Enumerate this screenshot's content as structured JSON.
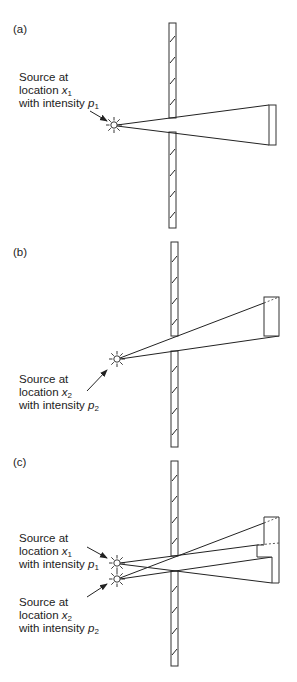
{
  "panels": [
    {
      "id": "a",
      "label": "(a)",
      "sources": [
        {
          "line1": "Source at",
          "line2_prefix": "location ",
          "var": "x",
          "var_sub": "1",
          "line3_prefix": "with intensity ",
          "int": "p",
          "int_sub": "1"
        }
      ]
    },
    {
      "id": "b",
      "label": "(b)",
      "sources": [
        {
          "line1": "Source at",
          "line2_prefix": "location ",
          "var": "x",
          "var_sub": "2",
          "line3_prefix": "with intensity ",
          "int": "p",
          "int_sub": "2"
        }
      ]
    },
    {
      "id": "c",
      "label": "(c)",
      "sources": [
        {
          "line1": "Source at",
          "line2_prefix": "location ",
          "var": "x",
          "var_sub": "1",
          "line3_prefix": "with intensity ",
          "int": "p",
          "int_sub": "1"
        },
        {
          "line1": "Source at",
          "line2_prefix": "location ",
          "var": "x",
          "var_sub": "2",
          "line3_prefix": "with intensity ",
          "int": "p",
          "int_sub": "2"
        }
      ]
    }
  ],
  "icons": {
    "source": "radiating-sun-icon",
    "arrow": "pointer-arrow"
  },
  "colors": {
    "line": "#222222",
    "background": "#ffffff"
  }
}
